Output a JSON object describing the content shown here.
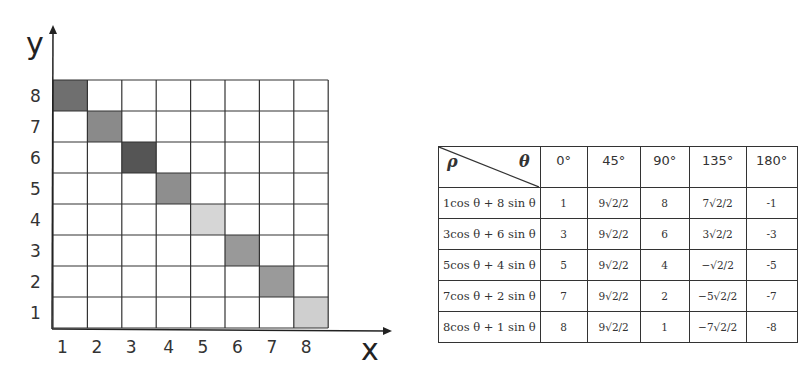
{
  "grid": {
    "x_axis_label": "x",
    "y_axis_label": "y",
    "x_ticks": [
      "1",
      "2",
      "3",
      "4",
      "5",
      "6",
      "7",
      "8"
    ],
    "y_ticks": [
      "1",
      "2",
      "3",
      "4",
      "5",
      "6",
      "7",
      "8"
    ],
    "shaded_cells": [
      {
        "x": 1,
        "y": 8,
        "color": "#6f6f6f"
      },
      {
        "x": 2,
        "y": 7,
        "color": "#8a8a8a"
      },
      {
        "x": 3,
        "y": 6,
        "color": "#555555"
      },
      {
        "x": 4,
        "y": 5,
        "color": "#8e8e8e"
      },
      {
        "x": 5,
        "y": 4,
        "color": "#d6d6d6"
      },
      {
        "x": 6,
        "y": 3,
        "color": "#999999"
      },
      {
        "x": 7,
        "y": 2,
        "color": "#9a9a9a"
      },
      {
        "x": 8,
        "y": 1,
        "color": "#cfcfcf"
      }
    ]
  },
  "table": {
    "corner": {
      "row_label": "ρ",
      "col_label": "θ"
    },
    "headers": [
      "0°",
      "45°",
      "90°",
      "135°",
      "180°"
    ],
    "rows": [
      {
        "expr": "1cos θ + 8 sin θ",
        "values": [
          "1",
          "9√2/2",
          "8",
          "7√2/2",
          "-1"
        ]
      },
      {
        "expr": "3cos θ + 6 sin θ",
        "values": [
          "3",
          "9√2/2",
          "6",
          "3√2/2",
          "-3"
        ]
      },
      {
        "expr": "5cos θ + 4 sin θ",
        "values": [
          "5",
          "9√2/2",
          "4",
          "−√2/2",
          "-5"
        ]
      },
      {
        "expr": "7cos θ + 2 sin θ",
        "values": [
          "7",
          "9√2/2",
          "2",
          "−5√2/2",
          "-7"
        ]
      },
      {
        "expr": "8cos θ + 1 sin θ",
        "values": [
          "8",
          "9√2/2",
          "1",
          "−7√2/2",
          "-8"
        ]
      }
    ]
  }
}
